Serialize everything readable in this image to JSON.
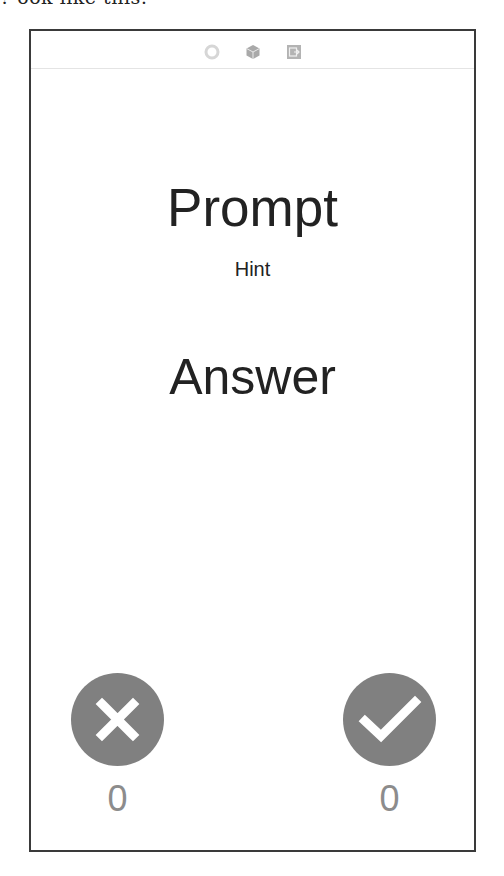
{
  "caption_fragment": "? ook like this:",
  "scene_dock": {
    "icons": [
      {
        "name": "view-controller-icon",
        "color": "#d9d9d9"
      },
      {
        "name": "first-responder-icon",
        "color": "#a8a8a8"
      },
      {
        "name": "exit-icon",
        "color": "#a8a8a8"
      }
    ]
  },
  "card": {
    "prompt": "Prompt",
    "hint": "Hint",
    "answer": "Answer"
  },
  "controls": {
    "wrong": {
      "icon": "x-mark-icon",
      "count": "0",
      "color": "#808080"
    },
    "right": {
      "icon": "checkmark-icon",
      "count": "0",
      "color": "#808080"
    }
  }
}
